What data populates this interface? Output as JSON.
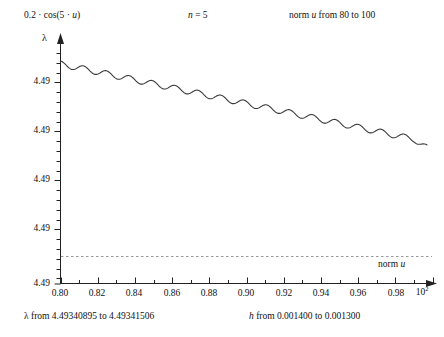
{
  "header": {
    "formula_prefix": "0.2 · cos(5 · ",
    "formula_var": "u",
    "formula_suffix": ")",
    "n_label_prefix": "n",
    "n_label_value": " = 5",
    "norm_prefix": "norm ",
    "norm_var": "u",
    "norm_suffix": " from 80 to 100"
  },
  "axes": {
    "y_axis_symbol": "λ",
    "y_ticks": [
      "4.49",
      "4.49",
      "4.49",
      "4.49",
      "4.49"
    ],
    "x_ticks": [
      "0.80",
      "0.82",
      "0.84",
      "0.86",
      "0.88",
      "0.90",
      "0.92",
      "0.94",
      "0.96",
      "0.98"
    ],
    "x_exponent_base": "10",
    "x_exponent_power": "2"
  },
  "annotations": {
    "norm_u_prefix": "norm ",
    "norm_u_var": "u"
  },
  "captions": {
    "lambda_symbol": "λ",
    "lambda_range": " from 4.49340895 to 4.49341506",
    "h_symbol": "h",
    "h_range": " from 0.001400 to 0.001300"
  },
  "colors": {
    "curve": "#3a3a3a",
    "axis": "#222222",
    "dashed_line": "#999999",
    "text": "#111111",
    "background": "#ffffff"
  },
  "chart_data": {
    "type": "line",
    "title": "0.2 · cos(5 · u)",
    "subtitle": "n = 5",
    "xlabel": "h from 0.001400 to 0.001300",
    "ylabel": "λ from 4.49340895 to 4.49341506",
    "xlim": [
      0.8,
      1.0
    ],
    "ylim": [
      4.49340895,
      4.49341506
    ],
    "x_tick_values": [
      0.8,
      0.82,
      0.84,
      0.86,
      0.88,
      0.9,
      0.92,
      0.94,
      0.96,
      0.98
    ],
    "x_scale_exponent": "10^2",
    "y_tick_labels": [
      "4.49",
      "4.49",
      "4.49",
      "4.49",
      "4.49"
    ],
    "grid": false,
    "legend": null,
    "series": [
      {
        "name": "lambda",
        "description": "Descending trend with superimposed cosine ripple of 5 cycles per unit u, u from 80 to 100",
        "trend_start": 4.49341506,
        "trend_end": 4.4934101,
        "ripple_amplitude": 2.2e-07,
        "ripple_cycles": 16,
        "x": [
          0.8,
          0.805,
          0.81,
          0.815,
          0.82,
          0.825,
          0.83,
          0.835,
          0.84,
          0.845,
          0.85,
          0.855,
          0.86,
          0.865,
          0.87,
          0.875,
          0.88,
          0.885,
          0.89,
          0.895,
          0.9,
          0.905,
          0.91,
          0.915,
          0.92,
          0.925,
          0.93,
          0.935,
          0.94,
          0.945,
          0.95,
          0.955,
          0.96,
          0.965,
          0.97,
          0.975,
          0.98,
          0.985,
          0.99,
          0.995,
          1.0
        ],
        "y_pixel": [
          64.0,
          65.5,
          68.0,
          69.5,
          71.0,
          73.5,
          76.0,
          77.5,
          79.0,
          81.5,
          84.0,
          85.5,
          87.0,
          89.5,
          92.0,
          93.5,
          95.0,
          97.5,
          100.0,
          101.5,
          103.0,
          105.5,
          108.0,
          109.5,
          111.0,
          113.5,
          116.0,
          117.5,
          119.0,
          121.5,
          124.0,
          125.5,
          127.0,
          129.5,
          132.0,
          133.5,
          135.0,
          137.5,
          140.0,
          143.0,
          148.0
        ]
      },
      {
        "name": "norm u reference",
        "type": "horizontal-dashed",
        "y_pixel": 256,
        "label": "norm u"
      }
    ]
  }
}
